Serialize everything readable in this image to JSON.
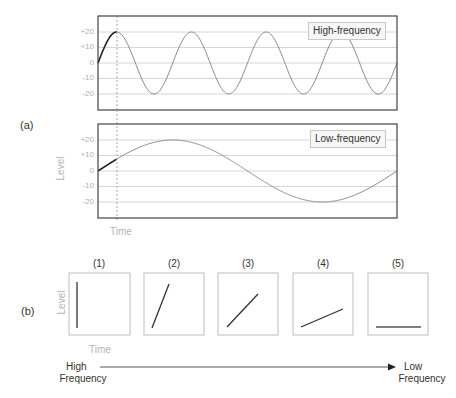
{
  "panels": {
    "a_label": "(a)",
    "b_label": "(b)"
  },
  "chart_data": [
    {
      "type": "line",
      "title": "High-frequency",
      "legend": [
        "High-frequency"
      ],
      "xlabel": "Time",
      "ylabel": "Level",
      "yticks": [
        "+20",
        "+10",
        "0",
        "-10",
        "-20"
      ],
      "ylim": [
        -30,
        30
      ],
      "cycles": 4,
      "amplitude": 20,
      "series": [
        {
          "name": "High-frequency",
          "function": "20*sin(2*pi*4*t)",
          "t_range": [
            0,
            1
          ]
        }
      ],
      "marker_x": 0.0625,
      "grid": true
    },
    {
      "type": "line",
      "title": "Low-frequency",
      "legend": [
        "Low-frequency"
      ],
      "xlabel": "Time",
      "ylabel": "Level",
      "yticks": [
        "+20",
        "+10",
        "0",
        "-10",
        "-20"
      ],
      "ylim": [
        -30,
        30
      ],
      "cycles": 1,
      "amplitude": 20,
      "series": [
        {
          "name": "Low-frequency",
          "function": "20*sin(2*pi*1*t)",
          "t_range": [
            0,
            1
          ]
        }
      ],
      "marker_x": 0.0625,
      "grid": true
    },
    {
      "type": "line",
      "title": "Slope vs frequency",
      "xlabel": "Time",
      "ylabel": "Level",
      "categories": [
        "(1)",
        "(2)",
        "(3)",
        "(4)",
        "(5)"
      ],
      "slopes_description": [
        "vertical",
        "steep",
        "45 degrees",
        "shallow",
        "flat"
      ]
    }
  ],
  "top_chart": {
    "legend": "High-frequency",
    "yticks": [
      "+20",
      "+10",
      "0",
      "-10",
      "-20"
    ]
  },
  "bottom_chart": {
    "legend": "Low-frequency",
    "yticks": [
      "+20",
      "+10",
      "0",
      "-10",
      "-20"
    ],
    "ylabel": "Level",
    "xlabel": "Time"
  },
  "slopes": {
    "ylabel": "Level",
    "xlabel": "Time",
    "boxes": [
      {
        "label": "(1)"
      },
      {
        "label": "(2)"
      },
      {
        "label": "(3)"
      },
      {
        "label": "(4)"
      },
      {
        "label": "(5)"
      }
    ],
    "arrow_start_line1": "High",
    "arrow_start_line2": "Frequency",
    "arrow_end_line1": "Low",
    "arrow_end_line2": "Frequency"
  }
}
